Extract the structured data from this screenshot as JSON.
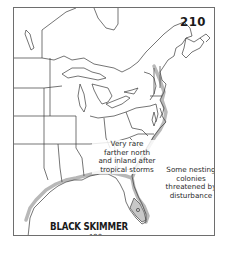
{
  "map": {
    "plate_number": "210",
    "species_title": "BLACK SKIMMER",
    "page_reference": "p. 190",
    "annotations": {
      "inland_note": [
        "Very rare",
        "farther north",
        "and inland after",
        "tropical storms"
      ],
      "coastal_note": [
        "Some nesting",
        "colonies",
        "threatened by",
        "disturbance"
      ]
    },
    "legend_colors": {
      "range_shading": "#b8b8b8",
      "outline": "#3a3a3a",
      "frame": "#6e6e6e"
    }
  }
}
